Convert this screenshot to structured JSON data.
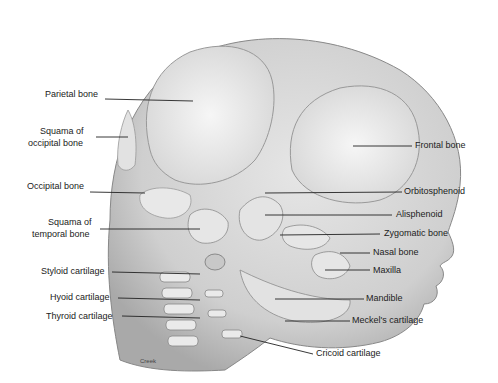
{
  "figure": {
    "credit": "Creek"
  },
  "labels": {
    "left": [
      {
        "text": "Parietal bone",
        "x": 45,
        "y": 94
      },
      {
        "text": "Squama of",
        "x": 40,
        "y": 131
      },
      {
        "text": "occipital bone",
        "x": 28,
        "y": 143
      },
      {
        "text": "Occipital bone",
        "x": 27,
        "y": 186
      },
      {
        "text": "Squama of",
        "x": 48,
        "y": 222
      },
      {
        "text": "temporal bone",
        "x": 32,
        "y": 234
      },
      {
        "text": "Styloid cartilage",
        "x": 41,
        "y": 266
      },
      {
        "text": "Hyoid cartilage",
        "x": 50,
        "y": 292
      },
      {
        "text": "Thyroid cartilage",
        "x": 46,
        "y": 311
      }
    ],
    "right": [
      {
        "text": "Frontal bone",
        "x": 415,
        "y": 140
      },
      {
        "text": "Orbitosphenoid",
        "x": 404,
        "y": 186
      },
      {
        "text": "Alisphenoid",
        "x": 396,
        "y": 209
      },
      {
        "text": "Zygomatic bone",
        "x": 384,
        "y": 228
      },
      {
        "text": "Nasal bone",
        "x": 373,
        "y": 246
      },
      {
        "text": "Maxilla",
        "x": 373,
        "y": 265
      },
      {
        "text": "Mandible",
        "x": 366,
        "y": 293
      },
      {
        "text": "Meckel's cartilage",
        "x": 352,
        "y": 315
      },
      {
        "text": "Cricoid cartilage",
        "x": 316,
        "y": 349
      }
    ]
  },
  "colors": {
    "skull_fill": "#d4d4d4",
    "bone_fill": "#ececec",
    "line": "#222222",
    "text": "#222222"
  }
}
